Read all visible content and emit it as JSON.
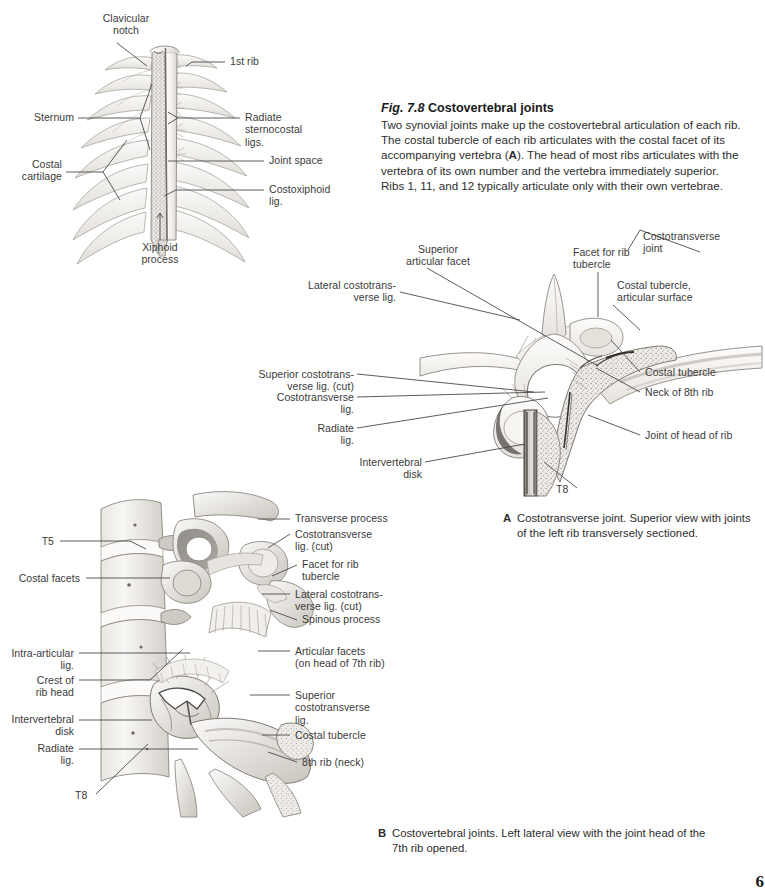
{
  "caption": {
    "fig_number": "Fig. 7.8",
    "title": "Costovertebral joints",
    "body_part1": "Two synovial joints make up the costovertebral articulation of each rib. The costal tubercle of each rib articulates with the costal facet of its accompanying vertebra (",
    "body_bold1": "A",
    "body_part2": "). The head of most ribs articulates with the vertebra of its own number and the vertebra immediately superior. Ribs 1, 11, and 12 typically articulate only with their own vertebrae."
  },
  "sub_captions": {
    "a": {
      "letter": "A",
      "text": "Costotransverse joint. Superior view with joints of the left rib transversely sectioned."
    },
    "b": {
      "letter": "B",
      "text": "Costovertebral joints. Left lateral view with the joint head of the 7th rib opened."
    }
  },
  "page_number": "6",
  "sternum_figure": {
    "labels": [
      {
        "id": "clavicular-notch",
        "text": "Clavicular\nnotch"
      },
      {
        "id": "first-rib",
        "text": "1st rib"
      },
      {
        "id": "sternum",
        "text": "Sternum"
      },
      {
        "id": "radiate-sternocostal",
        "text": "Radiate\nsternocostal\nligs."
      },
      {
        "id": "costal-cartilage",
        "text": "Costal\ncartilage"
      },
      {
        "id": "joint-space",
        "text": "Joint space"
      },
      {
        "id": "costoxiphoid-lig",
        "text": "Costoxiphoid\nlig."
      },
      {
        "id": "xiphoid-process",
        "text": "Xiphoid\nprocess"
      }
    ]
  },
  "figure_a": {
    "labels": [
      {
        "id": "superior-articular-facet",
        "text": "Superior\narticular facet"
      },
      {
        "id": "lateral-costotransverse-lig",
        "text": "Lateral costotrans-\nverse lig."
      },
      {
        "id": "superior-costotransverse-lig-cut",
        "text": "Superior costotrans-\nverse lig. (cut)"
      },
      {
        "id": "costotransverse-lig",
        "text": "Costotransverse\nlig."
      },
      {
        "id": "radiate-lig",
        "text": "Radiate\nlig."
      },
      {
        "id": "intervertebral-disk",
        "text": "Intervertebral\ndisk"
      },
      {
        "id": "facet-for-rib-tubercle",
        "text": "Facet for rib\ntubercle"
      },
      {
        "id": "costotransverse-joint",
        "text": "Costotransverse\njoint"
      },
      {
        "id": "costal-tubercle-articular-surface",
        "text": "Costal tubercle,\narticular surface"
      },
      {
        "id": "costal-tubercle",
        "text": "Costal tubercle"
      },
      {
        "id": "neck-of-8th-rib",
        "text": "Neck of 8th rib"
      },
      {
        "id": "joint-of-head-of-rib",
        "text": "Joint of head of rib"
      },
      {
        "id": "t8",
        "text": "T8"
      }
    ]
  },
  "figure_b": {
    "labels": [
      {
        "id": "t5",
        "text": "T5"
      },
      {
        "id": "costal-facets",
        "text": "Costal facets"
      },
      {
        "id": "intra-articular-lig",
        "text": "Intra-articular\nlig."
      },
      {
        "id": "crest-of-rib-head",
        "text": "Crest of\nrib head"
      },
      {
        "id": "intervertebral-disk",
        "text": "Intervertebral\ndisk"
      },
      {
        "id": "radiate-lig",
        "text": "Radiate\nlig."
      },
      {
        "id": "t8",
        "text": "T8"
      },
      {
        "id": "transverse-process",
        "text": "Transverse process"
      },
      {
        "id": "costotransverse-lig-cut",
        "text": "Costotransverse\nlig. (cut)"
      },
      {
        "id": "facet-for-rib-tubercle",
        "text": "Facet for rib\ntubercle"
      },
      {
        "id": "lateral-costotransverse-lig-cut",
        "text": "Lateral costotrans-\nverse lig. (cut)"
      },
      {
        "id": "spinous-process",
        "text": "Spinous process"
      },
      {
        "id": "articular-facets",
        "text": "Articular facets\n(on head of 7th rib)"
      },
      {
        "id": "superior-costotransverse-lig",
        "text": "Superior\ncostotransverse\nlig."
      },
      {
        "id": "costal-tubercle",
        "text": "Costal tubercle"
      },
      {
        "id": "eighth-rib-neck",
        "text": "8th rib (neck)"
      }
    ]
  },
  "colors": {
    "bone_light": "#f4f3f1",
    "bone_mid": "#dedbd6",
    "bone_shade": "#b9b5ae",
    "outline": "#8e8a83",
    "text": "#3a3a3a",
    "leader": "#4a4a4a"
  }
}
